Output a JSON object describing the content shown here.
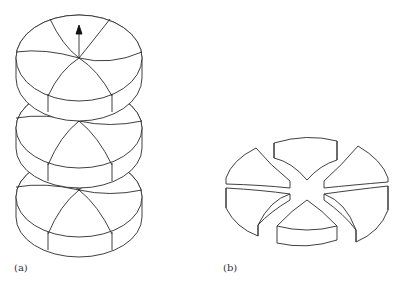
{
  "figure": {
    "panels": [
      {
        "id": "a",
        "label": "(a)",
        "description": "Stack of three sectored disks on a vertical axis with an upward arrow on top disk"
      },
      {
        "id": "b",
        "label": "(b)",
        "description": "Disk split into four separated wedge-shaped segments around an X-shaped gap"
      }
    ]
  },
  "colors": {
    "line": "#2a2a2a",
    "background": "#ffffff"
  }
}
